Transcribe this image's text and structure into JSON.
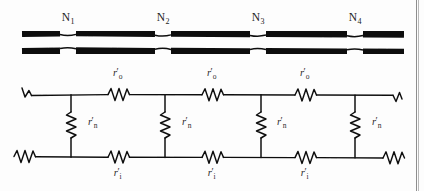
{
  "figure": {
    "ink_color": "#111111",
    "background_color": "#fdfdfd"
  },
  "fiber": {
    "description": "myelinated-axon-sheath",
    "nodes": [
      {
        "label": "N",
        "subscript": "1",
        "x": 68
      },
      {
        "label": "N",
        "subscript": "2",
        "x": 163
      },
      {
        "label": "N",
        "subscript": "3",
        "x": 258
      },
      {
        "label": "N",
        "subscript": "4",
        "x": 355
      }
    ]
  },
  "circuit": {
    "outer_resistors": [
      {
        "symbol": "r",
        "prime": "′",
        "subscript": "o",
        "x": 118
      },
      {
        "symbol": "r",
        "prime": "′",
        "subscript": "o",
        "x": 212
      },
      {
        "symbol": "r",
        "prime": "′",
        "subscript": "o",
        "x": 305
      }
    ],
    "nodal_resistors": [
      {
        "symbol": "r",
        "prime": "′",
        "subscript": "n",
        "x": 88
      },
      {
        "symbol": "r",
        "prime": "′",
        "subscript": "n",
        "x": 182
      },
      {
        "symbol": "r",
        "prime": "′",
        "subscript": "n",
        "x": 277
      },
      {
        "symbol": "r",
        "prime": "′",
        "subscript": "n",
        "x": 372
      }
    ],
    "inner_resistors": [
      {
        "symbol": "r",
        "prime": "′",
        "subscript": "i",
        "x": 118
      },
      {
        "symbol": "r",
        "prime": "′",
        "subscript": "i",
        "x": 212
      },
      {
        "symbol": "r",
        "prime": "′",
        "subscript": "i",
        "x": 305
      }
    ]
  }
}
